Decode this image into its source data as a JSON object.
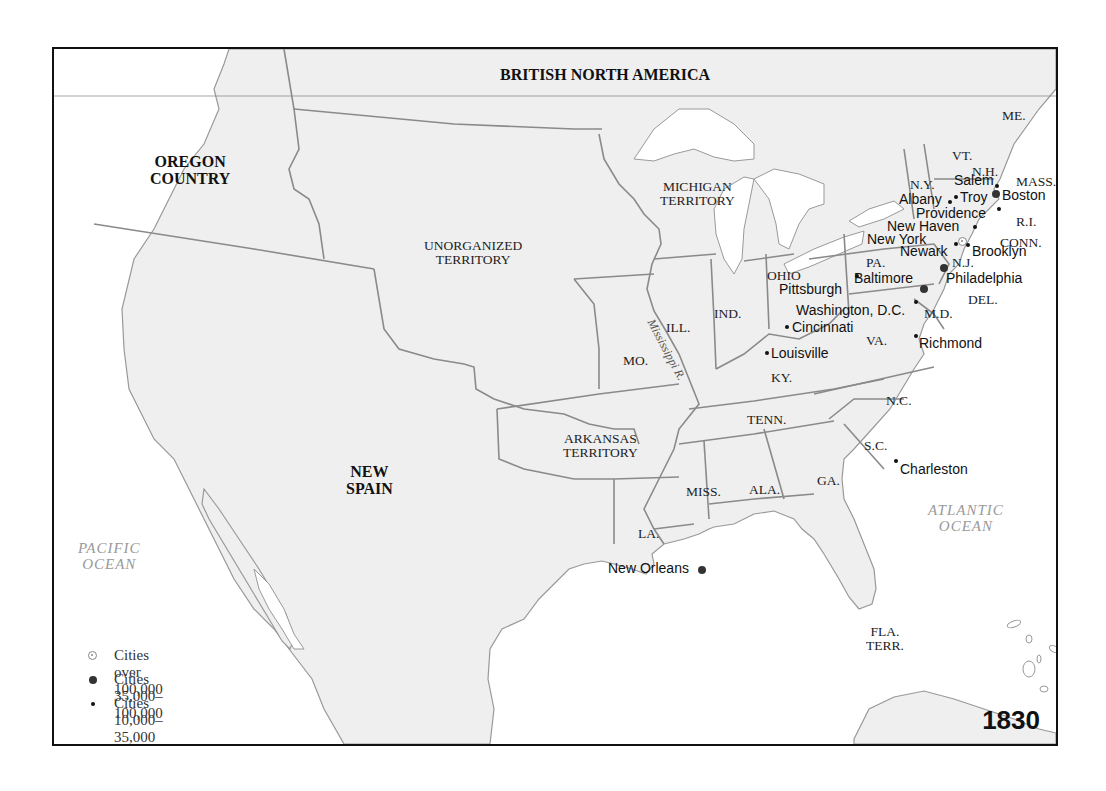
{
  "map": {
    "year": "1830",
    "colors": {
      "land": "#efefef",
      "water": "#ffffff",
      "border": "#8a8a8a",
      "frame": "#111111"
    },
    "regions_bold": [
      {
        "id": "british-north-america",
        "label": "BRITISH NORTH AMERICA"
      },
      {
        "id": "oregon-country",
        "label": "OREGON\nCOUNTRY"
      },
      {
        "id": "new-spain",
        "label": "NEW\nSPAIN"
      }
    ],
    "territories": [
      {
        "id": "unorganized-territory",
        "label": "UNORGANIZED\nTERRITORY"
      },
      {
        "id": "michigan-territory",
        "label": "MICHIGAN\nTERRITORY"
      },
      {
        "id": "arkansas-territory",
        "label": "ARKANSAS\nTERRITORY"
      },
      {
        "id": "florida-territory",
        "label": "FLA.\nTERR."
      }
    ],
    "states": [
      "ME.",
      "VT.",
      "N.H.",
      "MASS.",
      "R.I.",
      "CONN.",
      "N.Y.",
      "N.J.",
      "PA.",
      "DEL.",
      "M.D.",
      "OHIO",
      "IND.",
      "ILL.",
      "MO.",
      "KY.",
      "VA.",
      "N.C.",
      "TENN.",
      "S.C.",
      "GA.",
      "ALA.",
      "MISS.",
      "LA."
    ],
    "oceans": [
      {
        "id": "pacific-ocean",
        "label": "PACIFIC\nOCEAN"
      },
      {
        "id": "atlantic-ocean",
        "label": "ATLANTIC\nOCEAN"
      }
    ],
    "rivers": [
      {
        "id": "mississippi-river",
        "label": "Mississippi R."
      }
    ],
    "cities": [
      {
        "name": "New York",
        "size": "large"
      },
      {
        "name": "Baltimore",
        "size": "medium"
      },
      {
        "name": "Philadelphia",
        "size": "medium"
      },
      {
        "name": "Boston",
        "size": "medium"
      },
      {
        "name": "New Orleans",
        "size": "medium"
      },
      {
        "name": "Salem",
        "size": "small"
      },
      {
        "name": "Albany",
        "size": "small"
      },
      {
        "name": "Troy",
        "size": "small"
      },
      {
        "name": "Providence",
        "size": "small"
      },
      {
        "name": "New Haven",
        "size": "small"
      },
      {
        "name": "Newark",
        "size": "small"
      },
      {
        "name": "Brooklyn",
        "size": "small"
      },
      {
        "name": "Pittsburgh",
        "size": "small"
      },
      {
        "name": "Washington, D.C.",
        "size": "small"
      },
      {
        "name": "Cincinnati",
        "size": "small"
      },
      {
        "name": "Louisville",
        "size": "small"
      },
      {
        "name": "Richmond",
        "size": "small"
      },
      {
        "name": "Charleston",
        "size": "small"
      }
    ]
  },
  "legend": {
    "items": [
      {
        "symbol": "open-circle",
        "label": "Cities over 100,000"
      },
      {
        "symbol": "large-dot",
        "label": "Cities 35,000–100,000"
      },
      {
        "symbol": "small-dot",
        "label": "Cities 10,000–35,000"
      }
    ]
  }
}
